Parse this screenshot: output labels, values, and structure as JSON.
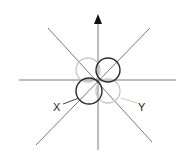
{
  "diagram": {
    "type": "orbital-lobes",
    "colors": {
      "axes": "#7a7a7a",
      "dark_lobe": "#2b2b2b",
      "light_lobe": "#c8c8c8",
      "arrow": "#111111"
    },
    "labels": {
      "x": "X",
      "y": "Y"
    }
  }
}
